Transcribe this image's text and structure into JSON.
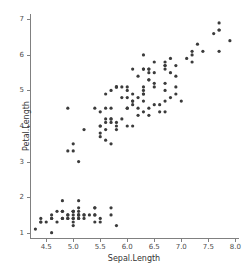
{
  "chart_data": {
    "type": "scatter",
    "title": "",
    "xlabel": "Sepal.Length",
    "ylabel": "Petal.Length",
    "xlim": [
      4.2,
      8.05
    ],
    "ylim": [
      0.85,
      7.15
    ],
    "grid": false,
    "legend": null,
    "marker": {
      "shape": "circle",
      "color": "#3b3b3b",
      "size_px": 3.2
    },
    "xticks": [
      "4.5",
      "5.0",
      "5.5",
      "6.0",
      "6.5",
      "7.0",
      "7.5",
      "8.0"
    ],
    "xtick_values": [
      4.5,
      5.0,
      5.5,
      6.0,
      6.5,
      7.0,
      7.5,
      8.0
    ],
    "yticks": [
      "1",
      "2",
      "3",
      "4",
      "5",
      "6",
      "7"
    ],
    "ytick_values": [
      1,
      2,
      3,
      4,
      5,
      6,
      7
    ],
    "axis_color": "#808080",
    "tick_label_color": "#4d4d4d",
    "axis_title_color": "#333333",
    "background": "#ffffff",
    "x": [
      5.1,
      4.9,
      4.7,
      4.6,
      5.0,
      5.4,
      4.6,
      5.0,
      4.4,
      4.9,
      5.4,
      4.8,
      4.8,
      4.3,
      5.8,
      5.7,
      5.4,
      5.1,
      5.7,
      5.1,
      5.4,
      5.1,
      4.6,
      5.1,
      4.8,
      5.0,
      5.0,
      5.2,
      5.2,
      4.7,
      4.8,
      5.4,
      5.2,
      5.5,
      4.9,
      5.0,
      5.5,
      4.9,
      4.4,
      5.1,
      5.0,
      4.5,
      4.4,
      5.0,
      5.1,
      4.8,
      5.1,
      4.6,
      5.3,
      5.0,
      7.0,
      6.4,
      6.9,
      5.5,
      6.5,
      5.7,
      6.3,
      4.9,
      6.6,
      5.2,
      5.0,
      5.9,
      6.0,
      6.1,
      5.6,
      6.7,
      5.6,
      5.8,
      6.2,
      5.6,
      5.9,
      6.1,
      6.3,
      6.1,
      6.4,
      6.6,
      6.8,
      6.7,
      6.0,
      5.7,
      5.5,
      5.5,
      5.8,
      6.0,
      5.4,
      6.0,
      6.7,
      6.3,
      5.6,
      5.5,
      5.5,
      6.1,
      5.8,
      5.0,
      5.6,
      5.7,
      5.7,
      6.2,
      5.1,
      5.7,
      6.3,
      5.8,
      7.1,
      6.3,
      6.5,
      7.6,
      4.9,
      7.3,
      6.7,
      7.2,
      6.5,
      6.4,
      6.8,
      5.7,
      5.8,
      6.4,
      6.5,
      7.7,
      7.7,
      6.0,
      6.9,
      5.6,
      7.7,
      6.3,
      6.7,
      7.2,
      6.2,
      6.1,
      6.4,
      7.2,
      7.4,
      7.9,
      6.4,
      6.3,
      6.1,
      7.7,
      6.3,
      6.4,
      6.0,
      6.9,
      6.7,
      6.9,
      5.8,
      6.8,
      6.7,
      6.7,
      6.3,
      6.5,
      6.2,
      5.9
    ],
    "y": [
      1.4,
      1.4,
      1.3,
      1.5,
      1.4,
      1.7,
      1.4,
      1.5,
      1.4,
      1.5,
      1.5,
      1.6,
      1.4,
      1.1,
      1.2,
      1.5,
      1.3,
      1.4,
      1.7,
      1.5,
      1.7,
      1.5,
      1.0,
      1.7,
      1.9,
      1.6,
      1.6,
      1.5,
      1.4,
      1.6,
      1.6,
      1.5,
      1.5,
      1.4,
      1.5,
      1.2,
      1.3,
      1.4,
      1.3,
      1.5,
      1.3,
      1.3,
      1.3,
      1.6,
      1.9,
      1.4,
      1.6,
      1.4,
      1.5,
      1.4,
      4.7,
      4.5,
      4.9,
      4.0,
      4.6,
      4.5,
      4.7,
      3.3,
      4.6,
      3.9,
      3.5,
      4.2,
      4.0,
      4.7,
      3.6,
      4.4,
      4.5,
      4.1,
      4.5,
      3.9,
      4.8,
      4.0,
      4.9,
      4.7,
      4.3,
      4.4,
      4.8,
      5.0,
      4.5,
      3.5,
      3.8,
      3.7,
      3.9,
      5.1,
      4.5,
      4.5,
      4.7,
      4.4,
      4.1,
      4.0,
      4.4,
      4.6,
      4.0,
      3.3,
      4.2,
      4.2,
      4.2,
      4.3,
      3.0,
      4.1,
      6.0,
      5.1,
      5.9,
      5.6,
      5.8,
      6.6,
      4.5,
      6.3,
      5.8,
      6.1,
      5.1,
      5.3,
      5.5,
      5.0,
      5.1,
      5.3,
      5.5,
      6.7,
      6.9,
      5.0,
      5.7,
      4.9,
      6.7,
      4.9,
      5.7,
      6.0,
      4.8,
      4.9,
      5.6,
      5.8,
      6.1,
      6.4,
      5.6,
      5.1,
      5.6,
      6.1,
      5.6,
      5.5,
      4.8,
      5.4,
      5.6,
      5.1,
      5.1,
      5.9,
      5.7,
      5.2,
      5.0,
      5.2,
      5.4,
      5.1
    ]
  }
}
